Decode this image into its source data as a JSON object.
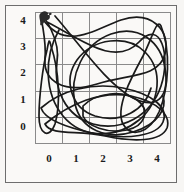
{
  "figure": {
    "title": "",
    "background_color": "#faf9f7",
    "frame_color": "#6d6d6d",
    "grid_color": "#8a8a8a",
    "curve_color": "#1a1a1a",
    "turtle_marker": "turtle-cursor-icon",
    "turtle_position": {
      "x": 0,
      "y": 4
    }
  },
  "axes": {
    "x_ticks": [
      "0",
      "1",
      "2",
      "3",
      "4"
    ],
    "y_ticks": [
      "4",
      "3",
      "2",
      "1",
      "0"
    ],
    "xlabel": "",
    "ylabel": ""
  },
  "chart_data": {
    "type": "line",
    "title": "",
    "xlabel": "",
    "ylabel": "",
    "xlim": [
      -0.5,
      4.5
    ],
    "ylim": [
      -0.5,
      4.5
    ],
    "x_ticks": [
      0,
      1,
      2,
      3,
      4
    ],
    "y_ticks": [
      0,
      1,
      2,
      3,
      4
    ],
    "grid": true,
    "legend": "none",
    "series": [
      {
        "name": "loop-1",
        "path": "M 7,6 C 30,40 58,18 86,8 C 116,-2 136,18 130,42 C 124,66 92,62 62,72 C 30,82 8,70 10,46 C 12,24 2,-8 7,6 Z"
      },
      {
        "name": "loop-2",
        "path": "M 12,10 C 44,26 80,56 104,30 C 126,6 136,44 126,74 C 116,104 86,120 58,112 C 30,104 18,76 22,50 C 26,26 6,2 12,10 Z"
      },
      {
        "name": "loop-3",
        "path": "M 20,4 C 46,34 72,72 98,86 C 126,100 134,80 130,56 C 126,30 104,12 76,22 C 48,32 34,64 40,92 C 46,118 72,128 98,120 C 124,112 132,96 128,84"
      },
      {
        "name": "loop-4",
        "path": "M 24,18 C 8,46 10,82 28,104 C 48,128 82,126 104,108 C 126,90 128,58 110,40 C 92,22 58,26 42,48 C 28,68 36,96 60,104 C 86,112 110,98 116,76"
      },
      {
        "name": "loop-5",
        "path": "M 6,96 C 26,78 58,70 88,76 C 118,82 134,96 128,110 C 122,124 92,128 62,122 C 32,116 10,108 6,96 Z"
      },
      {
        "name": "loop-6",
        "path": "M 10,112 C 34,92 66,78 96,84 C 124,90 136,104 132,116 C 126,130 98,130 70,124 C 42,118 16,124 10,112 Z"
      },
      {
        "name": "loop-7",
        "path": "M 48,94 C 62,80 88,78 102,88 C 116,98 110,114 92,118 C 72,122 52,114 48,104 Z"
      },
      {
        "name": "loop-8",
        "path": "M 126,14 C 136,38 134,76 124,100 C 114,122 96,126 88,112 C 80,96 96,66 108,44 C 118,24 122,6 126,14 Z"
      },
      {
        "name": "loop-9",
        "path": "M 16,34 C 24,58 26,92 20,112 C 14,128 4,122 4,104 C 4,84 8,54 12,38 C 14,28 14,26 16,34 Z"
      }
    ]
  }
}
